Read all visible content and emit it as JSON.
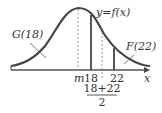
{
  "diagram": {
    "type": "normal-distribution-curve",
    "curve_label": "y=f(x)",
    "left_area_label": "G(18)",
    "right_area_label": "F(22)",
    "axis_label": "x",
    "tick_mean": "m",
    "tick_18": "18",
    "tick_22": "22",
    "midpoint_numerator": "18+22",
    "midpoint_denominator": "2",
    "colors": {
      "curve": "#444444",
      "axis": "#555555",
      "dashed": "#888888",
      "text": "#333333"
    }
  }
}
